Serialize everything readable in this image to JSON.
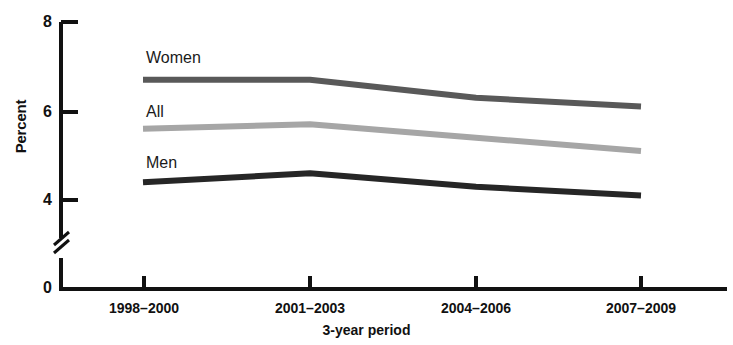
{
  "chart_data": {
    "type": "line",
    "title": "",
    "xlabel": "3-year period",
    "ylabel": "Percent",
    "categories": [
      "1998–2000",
      "2001–2003",
      "2004–2006",
      "2007–2009"
    ],
    "series": [
      {
        "name": "Women",
        "values": [
          6.7,
          6.7,
          6.3,
          6.1
        ],
        "color": "#595959"
      },
      {
        "name": "All",
        "values": [
          5.6,
          5.7,
          5.4,
          5.1
        ],
        "color": "#a6a6a6"
      },
      {
        "name": "Men",
        "values": [
          4.4,
          4.6,
          4.3,
          4.1
        ],
        "color": "#262626"
      }
    ],
    "yticks": [
      "0",
      "4",
      "6",
      "8"
    ],
    "ylim": [
      0,
      8
    ],
    "axis_break": true,
    "axis_break_between": [
      0,
      4
    ],
    "grid": false,
    "legend_position": "inline-left-of-series"
  },
  "axis": {
    "y_label": "Percent",
    "x_label": "3-year period",
    "tick_8": "8",
    "tick_6": "6",
    "tick_4": "4",
    "tick_0": "0"
  },
  "xaxis_labels": {
    "t0": "1998–2000",
    "t1": "2001–2003",
    "t2": "2004–2006",
    "t3": "2007–2009"
  },
  "series_labels": {
    "women": "Women",
    "all": "All",
    "men": "Men"
  }
}
